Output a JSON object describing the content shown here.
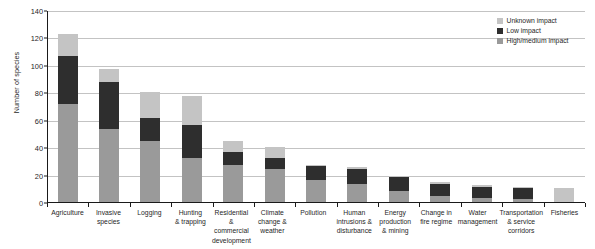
{
  "chart_data": {
    "type": "bar",
    "subtype": "stacked-vertical",
    "title": "",
    "xlabel": "",
    "ylabel": "Number of species",
    "ylim": [
      0,
      140
    ],
    "ytick_step": 20,
    "yticks": [
      "0",
      "20",
      "40",
      "60",
      "80",
      "100",
      "120",
      "140"
    ],
    "grid": "horizontal",
    "legend_position": "top-right",
    "categories": [
      "Agriculture",
      "Invasive species",
      "Logging",
      "Hunting & trapping",
      "Residential & commercial development",
      "Climate change & weather",
      "Pollution",
      "Human intrusions & disturbance",
      "Energy production & mining",
      "Change in fire regime",
      "Water management",
      "Transportation & service corridors",
      "Fisheries"
    ],
    "category_lines": [
      [
        "Agriculture"
      ],
      [
        "Invasive",
        "species"
      ],
      [
        "Logging"
      ],
      [
        "Hunting",
        "& trapping"
      ],
      [
        "Residential &",
        "commercial",
        "development"
      ],
      [
        "Climate",
        "change &",
        "weather"
      ],
      [
        "Pollution"
      ],
      [
        "Human",
        "intrusions &",
        "disturbance"
      ],
      [
        "Energy",
        "production",
        "& mining"
      ],
      [
        "Change in",
        "fire regime"
      ],
      [
        "Water",
        "management"
      ],
      [
        "Transportation",
        "& service",
        "corridors"
      ],
      [
        "Fisheries"
      ]
    ],
    "series": [
      {
        "name": "High/medium impact",
        "color": "#9a9a9a",
        "values": [
          72,
          54,
          45,
          33,
          28,
          25,
          17,
          14,
          9,
          5,
          4,
          3,
          0
        ]
      },
      {
        "name": "Low impact",
        "color": "#2e2e2e",
        "values": [
          35,
          34,
          17,
          24,
          9,
          8,
          10,
          11,
          10,
          9,
          8,
          8,
          0
        ]
      },
      {
        "name": "Unknown impact",
        "color": "#c4c4c4",
        "values": [
          16,
          10,
          19,
          21,
          8,
          8,
          1,
          1,
          1,
          1,
          1,
          1,
          11
        ]
      }
    ],
    "totals": [
      123,
      98,
      81,
      78,
      45,
      41,
      28,
      26,
      20,
      15,
      13,
      12,
      11
    ],
    "stack_order_bottom_to_top": [
      "High/medium impact",
      "Low impact",
      "Unknown impact"
    ]
  },
  "legend": {
    "items": [
      {
        "label": "Unknown impact",
        "color": "#c4c4c4"
      },
      {
        "label": "Low impact",
        "color": "#2e2e2e"
      },
      {
        "label": "High/medium impact",
        "color": "#9a9a9a"
      }
    ]
  }
}
